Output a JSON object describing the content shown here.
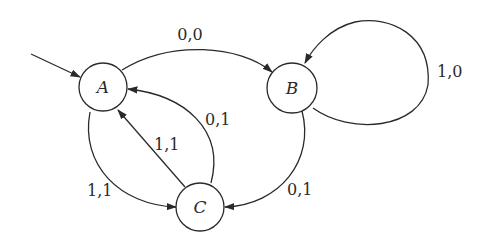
{
  "diagram": {
    "type": "finite-state-machine",
    "colors": {
      "stroke": "#2a2a2a",
      "background": "#ffffff"
    },
    "states": [
      {
        "id": "A",
        "label": "A",
        "initial": true
      },
      {
        "id": "B",
        "label": "B"
      },
      {
        "id": "C",
        "label": "C"
      }
    ],
    "transitions": [
      {
        "from": "A",
        "to": "B",
        "label": "0,0"
      },
      {
        "from": "B",
        "to": "B",
        "label": "1,0"
      },
      {
        "from": "B",
        "to": "C",
        "label": "0,1"
      },
      {
        "from": "C",
        "to": "A",
        "label": "0,1",
        "route": "outer"
      },
      {
        "from": "C",
        "to": "A",
        "label": "1,1",
        "route": "straight"
      },
      {
        "from": "A",
        "to": "C",
        "label": "1,1"
      }
    ]
  }
}
